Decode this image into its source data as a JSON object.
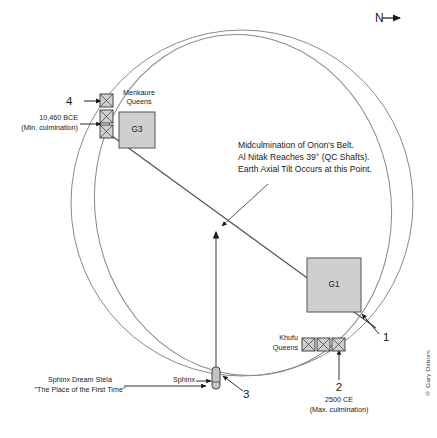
{
  "figure": {
    "north_indicator": "N",
    "copyright": "© Gary Osborn"
  },
  "annotations": {
    "center_note_line1": "Midculmination of Orion's Belt.",
    "center_note_line2": "Al Nitak Reaches 39° (QC Shafts).",
    "center_note_line3": "Earth Axial Tilt Occurs at this Point.",
    "left_note_line1": "10,460 BCE",
    "left_note_line2": "(Min. culmination)",
    "bottom_note_line1": "2500 CE",
    "bottom_note_line2": "(Max. culmination)",
    "sphinx_stela_line1": "Sphinx Dream Stela",
    "sphinx_stela_line2": "\"The Place of the First Time\""
  },
  "markers": {
    "one": "1",
    "two": "2",
    "three": "3",
    "four": "4"
  },
  "structures": {
    "pyramid_g1": "G1",
    "pyramid_g3": "G3",
    "menkaure_queens_line1": "Menkaure",
    "menkaure_queens_line2": "Queens",
    "khufu_queens_line1": "Khufu",
    "khufu_queens_line2": "Queens",
    "sphinx": "Sphinx"
  },
  "colors": {
    "stroke": "#6b6b6b",
    "line": "#3a3a3a",
    "pyramid_fill": "#cfcfcf",
    "pyramid_stroke": "#555555",
    "text": "#1a1a1a"
  }
}
